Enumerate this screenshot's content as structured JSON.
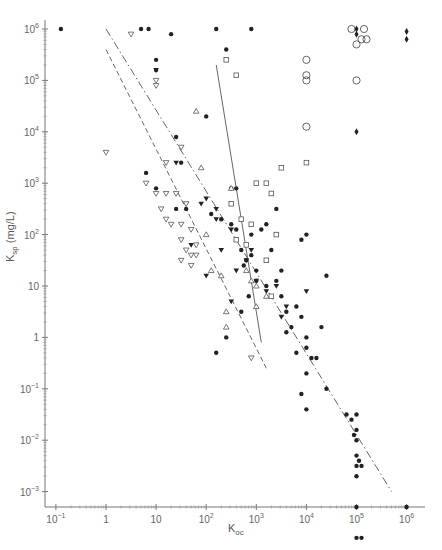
{
  "chart_data": {
    "type": "scatter",
    "title": "",
    "xlabel": "Koc",
    "ylabel": "Ksp (mg/L)",
    "xscale": "log",
    "yscale": "log",
    "xlim": [
      0.1,
      1000000
    ],
    "ylim": [
      0.001,
      1000000
    ],
    "grid": false,
    "legend": null,
    "x_ticks": [
      "10^-1",
      "1",
      "10",
      "10^2",
      "10^3",
      "10^4",
      "10^5",
      "10^6"
    ],
    "y_ticks": [
      "10^-3",
      "10^-2",
      "10^-1",
      "1",
      "10",
      "10^2",
      "10^3",
      "10^4",
      "10^5",
      "10^6"
    ],
    "series": [
      {
        "name": "filled circles",
        "marker": "filled-circle",
        "points_log10": [
          [
            -0.9,
            6.0
          ],
          [
            0.7,
            6.0
          ],
          [
            0.85,
            6.0
          ],
          [
            2.2,
            6.0
          ],
          [
            1.3,
            5.9
          ],
          [
            2.9,
            6.0
          ],
          [
            2.4,
            5.6
          ],
          [
            1.0,
            5.4
          ],
          [
            1.0,
            5.2
          ],
          [
            2.0,
            4.3
          ],
          [
            1.4,
            3.9
          ],
          [
            0.8,
            3.2
          ],
          [
            1.5,
            3.4
          ],
          [
            1.0,
            2.9
          ],
          [
            1.4,
            2.5
          ],
          [
            1.6,
            2.5
          ],
          [
            2.1,
            2.4
          ],
          [
            2.5,
            2.9
          ],
          [
            2.3,
            2.3
          ],
          [
            2.5,
            2.2
          ],
          [
            2.6,
            2.1
          ],
          [
            2.7,
            1.7
          ],
          [
            2.8,
            1.5
          ],
          [
            2.9,
            1.6
          ],
          [
            3.0,
            1.3
          ],
          [
            2.6,
            2.9
          ],
          [
            2.75,
            1.4
          ],
          [
            2.9,
            2.0
          ],
          [
            3.1,
            2.1
          ],
          [
            3.3,
            1.7
          ],
          [
            3.5,
            1.3
          ],
          [
            3.2,
            1.0
          ],
          [
            3.4,
            1.1
          ],
          [
            3.5,
            0.8
          ],
          [
            3.6,
            0.5
          ],
          [
            3.7,
            0.2
          ],
          [
            3.9,
            0.4
          ],
          [
            4.0,
            0.0
          ],
          [
            3.8,
            -0.3
          ],
          [
            4.1,
            -0.4
          ],
          [
            4.2,
            -0.4
          ],
          [
            4.0,
            -0.7
          ],
          [
            4.4,
            -1.0
          ],
          [
            4.0,
            2.0
          ],
          [
            4.4,
            1.2
          ],
          [
            3.9,
            1.9
          ],
          [
            3.4,
            2.5
          ],
          [
            3.2,
            2.2
          ],
          [
            3.0,
            1.1
          ],
          [
            2.85,
            0.8
          ],
          [
            2.7,
            0.5
          ],
          [
            2.4,
            0.0
          ],
          [
            2.2,
            -0.3
          ],
          [
            3.8,
            0.6
          ],
          [
            3.6,
            0.1
          ],
          [
            4.3,
            0.2
          ],
          [
            4.8,
            -1.5
          ],
          [
            5.0,
            -1.5
          ],
          [
            5.0,
            -1.8
          ],
          [
            5.0,
            -2.0
          ],
          [
            5.0,
            -2.3
          ],
          [
            5.0,
            -2.5
          ],
          [
            4.9,
            -1.6
          ],
          [
            4.95,
            -1.9
          ],
          [
            5.05,
            -2.4
          ],
          [
            5.1,
            -2.5
          ],
          [
            5.0,
            -2.7
          ],
          [
            5.0,
            -3.3
          ],
          [
            5.0,
            -3.9
          ],
          [
            5.1,
            -3.9
          ],
          [
            6.0,
            -3.3
          ],
          [
            4.0,
            -0.2
          ],
          [
            3.9,
            -1.1
          ],
          [
            4.0,
            -1.4
          ]
        ]
      },
      {
        "name": "filled inverted triangles",
        "marker": "filled-triangle-down",
        "points_log10": [
          [
            1.0,
            5.2
          ],
          [
            1.4,
            3.4
          ],
          [
            1.6,
            2.6
          ],
          [
            1.9,
            2.6
          ],
          [
            2.0,
            2.7
          ],
          [
            2.2,
            2.5
          ],
          [
            2.2,
            2.3
          ],
          [
            2.3,
            1.7
          ],
          [
            2.5,
            2.1
          ],
          [
            2.6,
            1.3
          ],
          [
            2.8,
            1.5
          ],
          [
            2.9,
            1.7
          ],
          [
            3.0,
            1.1
          ],
          [
            3.2,
            0.9
          ],
          [
            3.4,
            1.0
          ],
          [
            3.5,
            0.4
          ],
          [
            3.6,
            0.6
          ],
          [
            4.0,
            0.9
          ],
          [
            1.7,
            1.8
          ],
          [
            2.0,
            1.2
          ],
          [
            2.5,
            0.7
          ]
        ]
      },
      {
        "name": "open inverted triangles",
        "marker": "open-triangle-down",
        "points_log10": [
          [
            0.5,
            5.9
          ],
          [
            0.0,
            3.6
          ],
          [
            1.0,
            5.0
          ],
          [
            1.0,
            4.9
          ],
          [
            1.5,
            3.7
          ],
          [
            1.2,
            3.4
          ],
          [
            0.8,
            3.0
          ],
          [
            1.0,
            2.8
          ],
          [
            1.2,
            2.8
          ],
          [
            1.4,
            2.8
          ],
          [
            1.6,
            2.6
          ],
          [
            1.1,
            2.5
          ],
          [
            1.2,
            2.3
          ],
          [
            1.3,
            2.2
          ],
          [
            1.5,
            2.2
          ],
          [
            1.7,
            2.1
          ],
          [
            1.5,
            1.9
          ],
          [
            1.6,
            1.7
          ],
          [
            1.7,
            1.6
          ],
          [
            1.8,
            1.6
          ],
          [
            1.8,
            1.8
          ],
          [
            1.5,
            1.5
          ],
          [
            1.7,
            1.4
          ],
          [
            2.9,
            -0.4
          ]
        ]
      },
      {
        "name": "open triangles",
        "marker": "open-triangle-up",
        "points_log10": [
          [
            1.8,
            4.4
          ],
          [
            1.9,
            3.3
          ],
          [
            2.0,
            2.0
          ],
          [
            2.1,
            1.3
          ],
          [
            2.3,
            1.2
          ],
          [
            2.4,
            0.5
          ],
          [
            2.8,
            1.3
          ],
          [
            2.9,
            1.1
          ],
          [
            3.0,
            1.0
          ],
          [
            3.2,
            0.8
          ],
          [
            3.0,
            0.6
          ],
          [
            2.4,
            0.2
          ],
          [
            2.5,
            2.9
          ]
        ]
      },
      {
        "name": "open squares",
        "marker": "open-square",
        "points_log10": [
          [
            2.4,
            5.4
          ],
          [
            2.6,
            5.1
          ],
          [
            3.0,
            3.0
          ],
          [
            3.2,
            3.0
          ],
          [
            3.3,
            2.8
          ],
          [
            2.5,
            2.6
          ],
          [
            2.7,
            2.3
          ],
          [
            2.9,
            2.2
          ],
          [
            3.5,
            3.3
          ],
          [
            4.0,
            3.4
          ],
          [
            2.8,
            1.8
          ],
          [
            3.2,
            1.5
          ],
          [
            3.3,
            0.8
          ],
          [
            2.6,
            1.9
          ],
          [
            3.4,
            2.0
          ]
        ]
      },
      {
        "name": "open circles",
        "marker": "open-circle",
        "points_log10": [
          [
            4.0,
            5.4
          ],
          [
            4.0,
            5.1
          ],
          [
            4.0,
            5.0
          ],
          [
            4.0,
            4.1
          ],
          [
            4.9,
            6.0
          ],
          [
            5.15,
            6.0
          ],
          [
            5.1,
            5.8
          ],
          [
            5.2,
            5.8
          ],
          [
            5.0,
            5.7
          ],
          [
            5.0,
            5.0
          ]
        ]
      },
      {
        "name": "filled diamonds",
        "marker": "filled-diamond",
        "points_log10": [
          [
            5.0,
            6.0
          ],
          [
            5.0,
            5.9
          ],
          [
            6.0,
            5.95
          ],
          [
            6.0,
            5.8
          ],
          [
            5.0,
            4.0
          ]
        ]
      }
    ],
    "lines": [
      {
        "name": "dash-dot regression",
        "style": "dash-dot",
        "from_log10": [
          0.0,
          6.0
        ],
        "to_log10": [
          5.7,
          -3.0
        ]
      },
      {
        "name": "dashed regression",
        "style": "dashed",
        "from_log10": [
          0.0,
          5.6
        ],
        "to_log10": [
          3.2,
          -0.6
        ]
      },
      {
        "name": "solid regression",
        "style": "solid",
        "from_log10": [
          2.2,
          5.3
        ],
        "to_log10": [
          3.1,
          -0.1
        ]
      }
    ]
  },
  "axes": {
    "xlabel_main": "K",
    "xlabel_sub": "oc",
    "ylabel_main": "K",
    "ylabel_sub": "sp",
    "ylabel_unit": " (mg/L)"
  }
}
